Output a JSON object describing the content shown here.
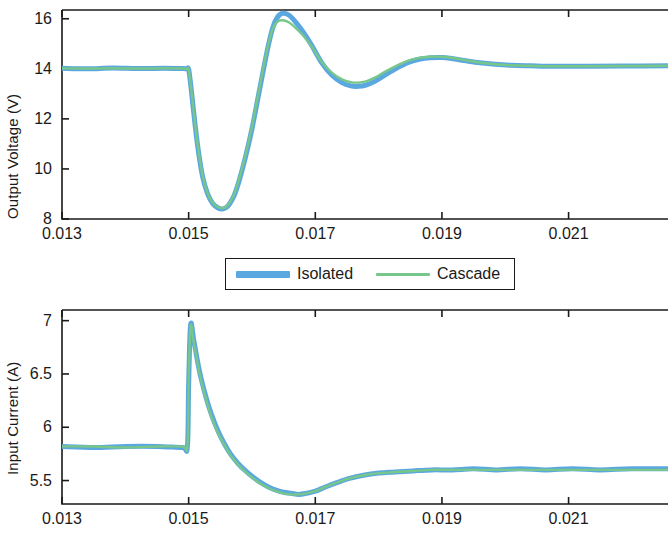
{
  "figure": {
    "background": "#ffffff",
    "axis_color": "#1a1a1a",
    "series_colors": {
      "isolated": "#5BA7E0",
      "cascade": "#77C68A"
    }
  },
  "legend": {
    "entries": [
      {
        "label": "Isolated",
        "color": "#5BA7E0",
        "style": "thick"
      },
      {
        "label": "Cascade",
        "color": "#77C68A",
        "style": "thin"
      }
    ]
  },
  "chart_data": [
    {
      "id": "output-voltage",
      "type": "line",
      "title": "",
      "xlabel": "",
      "ylabel": "Output Voltage (V)",
      "xlim": [
        0.013,
        0.02257
      ],
      "ylim": [
        8,
        16.35
      ],
      "xticks": [
        0.013,
        0.015,
        0.017,
        0.019,
        0.021
      ],
      "xtick_labels": [
        "0.013",
        "0.015",
        "0.017",
        "0.019",
        "0.021"
      ],
      "yticks": [
        8,
        10,
        12,
        14,
        16
      ],
      "ytick_labels": [
        "8",
        "10",
        "12",
        "14",
        "16"
      ],
      "grid": false,
      "legend_position": "below-center",
      "series": [
        {
          "name": "Isolated",
          "color": "#5BA7E0",
          "x": [
            0.013,
            0.0134,
            0.0138,
            0.0142,
            0.0146,
            0.0149,
            0.01497,
            0.015,
            0.01504,
            0.0151,
            0.01516,
            0.01522,
            0.0153,
            0.01538,
            0.01546,
            0.01553,
            0.01558,
            0.01564,
            0.01572,
            0.0158,
            0.0159,
            0.016,
            0.0161,
            0.01618,
            0.01626,
            0.01633,
            0.0164,
            0.01648,
            0.01658,
            0.01668,
            0.0168,
            0.01694,
            0.0171,
            0.01726,
            0.01742,
            0.01756,
            0.01768,
            0.0178,
            0.01794,
            0.0181,
            0.01828,
            0.01846,
            0.01864,
            0.01882,
            0.019,
            0.01918,
            0.01938,
            0.0196,
            0.01984,
            0.0201,
            0.0204,
            0.0208,
            0.0213,
            0.0219,
            0.02257
          ],
          "y": [
            14.02,
            14.0,
            14.03,
            14.01,
            14.02,
            14.01,
            14.0,
            13.98,
            13.2,
            11.8,
            10.6,
            9.7,
            9.0,
            8.62,
            8.45,
            8.4,
            8.44,
            8.58,
            8.95,
            9.55,
            10.5,
            11.6,
            12.9,
            13.95,
            14.95,
            15.65,
            16.05,
            16.22,
            16.15,
            15.9,
            15.5,
            14.95,
            14.25,
            13.75,
            13.45,
            13.32,
            13.3,
            13.35,
            13.5,
            13.75,
            14.02,
            14.25,
            14.38,
            14.44,
            14.45,
            14.4,
            14.32,
            14.24,
            14.18,
            14.14,
            14.12,
            14.1,
            14.1,
            14.11,
            14.12
          ]
        },
        {
          "name": "Cascade",
          "color": "#77C68A",
          "x": [
            0.013,
            0.0134,
            0.0138,
            0.0142,
            0.0146,
            0.0149,
            0.01497,
            0.015,
            0.01504,
            0.0151,
            0.01516,
            0.01522,
            0.0153,
            0.01538,
            0.01546,
            0.01553,
            0.01558,
            0.01564,
            0.01572,
            0.0158,
            0.0159,
            0.016,
            0.0161,
            0.01618,
            0.01626,
            0.01633,
            0.0164,
            0.01648,
            0.01658,
            0.01668,
            0.0168,
            0.01694,
            0.0171,
            0.01726,
            0.01742,
            0.01756,
            0.01768,
            0.0178,
            0.01794,
            0.0181,
            0.01828,
            0.01846,
            0.01864,
            0.01882,
            0.019,
            0.01918,
            0.01938,
            0.0196,
            0.01984,
            0.0201,
            0.0204,
            0.0208,
            0.0213,
            0.0219,
            0.02257
          ],
          "y": [
            14.02,
            14.01,
            14.02,
            14.01,
            14.02,
            14.01,
            14.0,
            13.98,
            13.22,
            11.84,
            10.65,
            9.74,
            9.03,
            8.65,
            8.48,
            8.43,
            8.47,
            8.62,
            9.0,
            9.62,
            10.58,
            11.7,
            13.0,
            14.05,
            15.0,
            15.62,
            15.88,
            15.94,
            15.86,
            15.66,
            15.35,
            14.9,
            14.28,
            13.85,
            13.58,
            13.47,
            13.45,
            13.5,
            13.65,
            13.88,
            14.12,
            14.32,
            14.44,
            14.48,
            14.48,
            14.43,
            14.34,
            14.25,
            14.18,
            14.14,
            14.12,
            14.1,
            14.1,
            14.11,
            14.12
          ]
        }
      ]
    },
    {
      "id": "input-current",
      "type": "line",
      "title": "",
      "xlabel": "",
      "ylabel": "Input Current (A)",
      "xlim": [
        0.013,
        0.02257
      ],
      "ylim": [
        5.28,
        7.1
      ],
      "xticks": [
        0.013,
        0.015,
        0.017,
        0.019,
        0.021
      ],
      "xtick_labels": [
        "0.013",
        "0.015",
        "0.017",
        "0.019",
        "0.021"
      ],
      "yticks": [
        5.5,
        6,
        6.5,
        7
      ],
      "ytick_labels": [
        "5.5",
        "6",
        "6.5",
        "7"
      ],
      "grid": false,
      "legend_position": "above-center",
      "series": [
        {
          "name": "Isolated",
          "color": "#5BA7E0",
          "x": [
            0.013,
            0.0135,
            0.014,
            0.0145,
            0.0149,
            0.01498,
            0.015,
            0.01503,
            0.01508,
            0.01514,
            0.0152,
            0.01528,
            0.01536,
            0.01546,
            0.01556,
            0.01566,
            0.01578,
            0.0159,
            0.01602,
            0.01614,
            0.01626,
            0.01638,
            0.0165,
            0.01662,
            0.01674,
            0.01686,
            0.017,
            0.01716,
            0.01734,
            0.01754,
            0.01776,
            0.018,
            0.01826,
            0.01854,
            0.01884,
            0.01916,
            0.0195,
            0.01986,
            0.02024,
            0.02064,
            0.02106,
            0.0215,
            0.022,
            0.02257
          ],
          "y": [
            5.82,
            5.81,
            5.82,
            5.82,
            5.81,
            5.82,
            6.4,
            6.96,
            6.82,
            6.62,
            6.45,
            6.27,
            6.12,
            5.97,
            5.85,
            5.75,
            5.66,
            5.59,
            5.53,
            5.48,
            5.44,
            5.41,
            5.39,
            5.38,
            5.37,
            5.38,
            5.4,
            5.44,
            5.48,
            5.52,
            5.55,
            5.57,
            5.58,
            5.59,
            5.6,
            5.6,
            5.61,
            5.6,
            5.61,
            5.6,
            5.61,
            5.6,
            5.61,
            5.61
          ]
        },
        {
          "name": "Cascade",
          "color": "#77C68A",
          "x": [
            0.013,
            0.0135,
            0.014,
            0.0145,
            0.0149,
            0.01498,
            0.015,
            0.01503,
            0.01508,
            0.01514,
            0.0152,
            0.01528,
            0.01536,
            0.01546,
            0.01556,
            0.01566,
            0.01578,
            0.0159,
            0.01602,
            0.01614,
            0.01626,
            0.01638,
            0.0165,
            0.01662,
            0.01674,
            0.01686,
            0.017,
            0.01716,
            0.01734,
            0.01754,
            0.01776,
            0.018,
            0.01826,
            0.01854,
            0.01884,
            0.01916,
            0.0195,
            0.01986,
            0.02024,
            0.02064,
            0.02106,
            0.0215,
            0.022,
            0.02257
          ],
          "y": [
            5.82,
            5.82,
            5.81,
            5.82,
            5.82,
            5.82,
            6.42,
            6.95,
            6.8,
            6.6,
            6.43,
            6.25,
            6.1,
            5.95,
            5.84,
            5.74,
            5.65,
            5.58,
            5.52,
            5.47,
            5.43,
            5.4,
            5.38,
            5.37,
            5.37,
            5.38,
            5.4,
            5.44,
            5.48,
            5.52,
            5.55,
            5.57,
            5.58,
            5.59,
            5.6,
            5.6,
            5.6,
            5.6,
            5.6,
            5.6,
            5.6,
            5.6,
            5.6,
            5.6
          ]
        }
      ]
    }
  ]
}
